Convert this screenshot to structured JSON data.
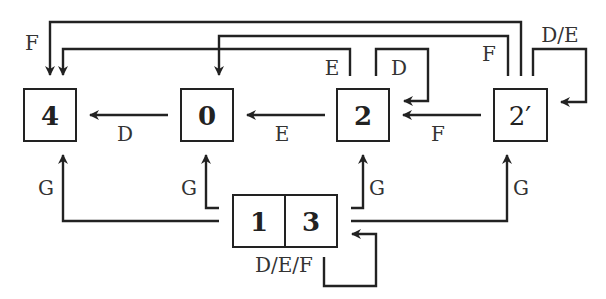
{
  "nodes": {
    "n4": {
      "label": "4"
    },
    "n0": {
      "label": "0"
    },
    "n2": {
      "label": "2"
    },
    "n2p": {
      "label": "2′"
    },
    "n1": {
      "label": "1"
    },
    "n3": {
      "label": "3"
    }
  },
  "edges": [
    {
      "from": "0",
      "to": "4",
      "label": "D"
    },
    {
      "from": "2",
      "to": "0",
      "label": "E"
    },
    {
      "from": "2′",
      "to": "2",
      "label": "F"
    },
    {
      "from": "2",
      "to": "4",
      "label": "E"
    },
    {
      "from": "2",
      "to": "2",
      "label": "D"
    },
    {
      "from": "2′",
      "to": "4",
      "label": "F"
    },
    {
      "from": "2′",
      "to": "0",
      "label": "F"
    },
    {
      "from": "2′",
      "to": "2",
      "label": "D/E"
    },
    {
      "from": "1 3",
      "to": "4",
      "label": "G"
    },
    {
      "from": "1 3",
      "to": "0",
      "label": "G"
    },
    {
      "from": "1 3",
      "to": "2",
      "label": "G"
    },
    {
      "from": "1 3",
      "to": "2′",
      "label": "G"
    },
    {
      "from": "1 3",
      "to": "1 3",
      "label": "D/E/F"
    }
  ],
  "labels": {
    "top_f_left": "F",
    "d_0_4": "D",
    "e_2_0": "E",
    "f_2p_2": "F",
    "e_top_2": "E",
    "d_loop_2": "D",
    "f_top_2p": "F",
    "de_loop_2p": "D/E",
    "g_4": "G",
    "g_0": "G",
    "g_2": "G",
    "g_2p": "G",
    "def_loop_13": "D/E/F"
  }
}
